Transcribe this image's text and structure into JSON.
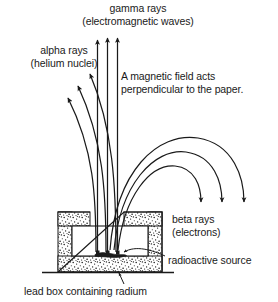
{
  "diagram": {
    "stroke_color": "#1a1a1a",
    "fill_color": "#ffffff",
    "labels": {
      "gamma": "gamma rays\n(electromagnetic waves)",
      "alpha": "alpha rays\n(helium nuclei)",
      "magnetic_field": "A magnetic field acts\nperpendicular to the paper.",
      "beta": "beta rays\n(electrons)",
      "source": "radioactive source",
      "lead_box": "lead box containing radium"
    },
    "elements": {
      "gamma_rays_count": 3,
      "alpha_rays_count": 3,
      "beta_rays_count": 3,
      "gamma_direction": "straight up, undeflected",
      "alpha_direction": "curved to the left",
      "beta_direction": "curved to the right and down",
      "container": "lead box with thick stippled walls open at the top",
      "ground_line": "horizontal baseline under the lead box"
    }
  }
}
